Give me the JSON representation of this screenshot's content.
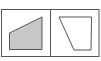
{
  "diagram": {
    "frame": {
      "x": 1.5,
      "y": 9.5,
      "w": 97.5,
      "h": 47,
      "stroke": "#555555"
    },
    "divider": {
      "x": 50.5
    },
    "panels": [
      {
        "name": "left-panel",
        "shape": "filled-quadrilateral",
        "points": "9.5,33 42,17 42,49.5 9.5,49.5",
        "fill": "#c8c8c8",
        "stroke": "#555555"
      },
      {
        "name": "right-panel",
        "shape": "outline-quadrilateral",
        "points": "59,17 91.5,17 91,50 74,50",
        "fill": "none",
        "stroke": "#555555"
      }
    ]
  }
}
